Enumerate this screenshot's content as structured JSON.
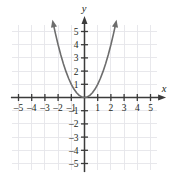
{
  "chart_data": {
    "type": "line",
    "title": "",
    "subtitle": "",
    "xlabel": "x",
    "ylabel": "y",
    "xlim": [
      -5.5,
      5.5
    ],
    "ylim": [
      -5.5,
      5.5
    ],
    "grid": true,
    "legend": null,
    "x_ticks": [
      -5,
      -4,
      -3,
      -2,
      -1,
      1,
      2,
      3,
      4,
      5
    ],
    "y_ticks": [
      -5,
      -4,
      -3,
      -2,
      -1,
      1,
      2,
      3,
      4,
      5
    ],
    "x_tick_labels": [
      "–5",
      "–4",
      "–3",
      "–2",
      "–1",
      "1",
      "2",
      "3",
      "4",
      "5"
    ],
    "y_tick_labels": [
      "–5",
      "–4",
      "–3",
      "–2",
      "–1",
      "1",
      "2",
      "3",
      "4",
      "5"
    ],
    "series": [
      {
        "name": "y = x²",
        "equation": "y = x^2",
        "shape": "parabola",
        "vertex": [
          0,
          0
        ],
        "opens": "up",
        "arrows": "both",
        "color": "#6d6d6d",
        "x": [
          -2.35,
          -2.2,
          -2.0,
          -1.8,
          -1.6,
          -1.4,
          -1.2,
          -1.0,
          -0.8,
          -0.6,
          -0.4,
          -0.2,
          0,
          0.2,
          0.4,
          0.6,
          0.8,
          1.0,
          1.2,
          1.4,
          1.6,
          1.8,
          2.0,
          2.2,
          2.35
        ],
        "values": [
          5.52,
          4.84,
          4.0,
          3.24,
          2.56,
          1.96,
          1.44,
          1.0,
          0.64,
          0.36,
          0.16,
          0.04,
          0,
          0.04,
          0.16,
          0.36,
          0.64,
          1.0,
          1.44,
          1.96,
          2.56,
          3.24,
          4.0,
          4.84,
          5.52
        ]
      }
    ]
  },
  "colors": {
    "grid": "#e6e6ea",
    "axis": "#3b3b3b",
    "curve": "#6d6d6d",
    "text": "#231f20",
    "background": "#ffffff"
  },
  "axis_labels": {
    "x": "x",
    "y": "y"
  }
}
